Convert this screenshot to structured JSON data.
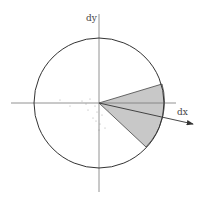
{
  "diagram": {
    "labels": {
      "x_axis": "dx",
      "y_axis": "dy"
    },
    "center": [
      99,
      103
    ],
    "radius": 65,
    "wedge": {
      "fill": "#c8c8c8",
      "upper_end": [
        162,
        84
      ],
      "lower_end": [
        146,
        147
      ]
    },
    "vector_end": [
      193,
      124
    ],
    "colors": {
      "stroke": "#333333",
      "axis": "#777777"
    }
  }
}
